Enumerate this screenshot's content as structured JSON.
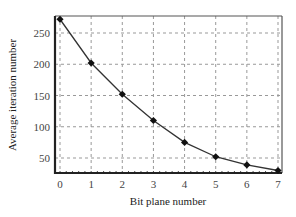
{
  "chart_data": {
    "type": "line",
    "title": "",
    "xlabel": "Bit plane number",
    "ylabel": "Average iteration number",
    "x": [
      0,
      1,
      2,
      3,
      4,
      5,
      6,
      7
    ],
    "series": [
      {
        "name": "Average iteration number",
        "values": [
          272,
          202,
          152,
          110,
          75,
          52,
          39,
          30
        ]
      }
    ],
    "xticks": [
      "0",
      "1",
      "2",
      "3",
      "4",
      "5",
      "6",
      "7"
    ],
    "yticks": [
      "50",
      "100",
      "150",
      "200",
      "250"
    ],
    "xlim": [
      -0.2,
      7.1
    ],
    "ylim": [
      22,
      280
    ],
    "grid": true,
    "grid_style": "dashed",
    "marker": "diamond",
    "legend": null
  }
}
